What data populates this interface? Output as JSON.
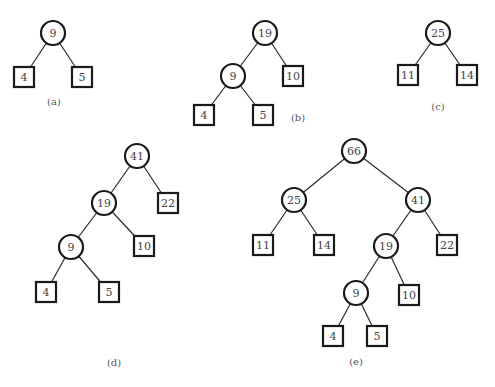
{
  "figure": {
    "style": {
      "stroke_color": "#1a1a1a",
      "text_color": "#444444",
      "background": "#ffffff"
    },
    "panels": [
      {
        "id": "a",
        "caption": "(a)",
        "caption_pos": [
          54,
          102
        ],
        "nodes": [
          {
            "id": "a9",
            "label": "9",
            "type": "circle",
            "x": 53,
            "y": 33
          },
          {
            "id": "a4",
            "label": "4",
            "type": "box",
            "x": 24,
            "y": 77
          },
          {
            "id": "a5",
            "label": "5",
            "type": "box",
            "x": 82,
            "y": 77
          }
        ],
        "edges": [
          [
            "a9",
            "a4"
          ],
          [
            "a9",
            "a5"
          ]
        ]
      },
      {
        "id": "b",
        "caption": "(b)",
        "caption_pos": [
          298,
          118
        ],
        "nodes": [
          {
            "id": "b19",
            "label": "19",
            "type": "circle",
            "x": 265,
            "y": 33
          },
          {
            "id": "b9",
            "label": "9",
            "type": "circle",
            "x": 233,
            "y": 76
          },
          {
            "id": "b10",
            "label": "10",
            "type": "box",
            "x": 293,
            "y": 76
          },
          {
            "id": "b4",
            "label": "4",
            "type": "box",
            "x": 204,
            "y": 115
          },
          {
            "id": "b5",
            "label": "5",
            "type": "box",
            "x": 263,
            "y": 115
          }
        ],
        "edges": [
          [
            "b19",
            "b9"
          ],
          [
            "b19",
            "b10"
          ],
          [
            "b9",
            "b4"
          ],
          [
            "b9",
            "b5"
          ]
        ]
      },
      {
        "id": "c",
        "caption": "(c)",
        "caption_pos": [
          438,
          107
        ],
        "nodes": [
          {
            "id": "c25",
            "label": "25",
            "type": "circle",
            "x": 438,
            "y": 33
          },
          {
            "id": "c11",
            "label": "11",
            "type": "box",
            "x": 408,
            "y": 75
          },
          {
            "id": "c14",
            "label": "14",
            "type": "box",
            "x": 467,
            "y": 75
          }
        ],
        "edges": [
          [
            "c25",
            "c11"
          ],
          [
            "c25",
            "c14"
          ]
        ]
      },
      {
        "id": "d",
        "caption": "(d)",
        "caption_pos": [
          114,
          363
        ],
        "nodes": [
          {
            "id": "d41",
            "label": "41",
            "type": "circle",
            "x": 137,
            "y": 156
          },
          {
            "id": "d19",
            "label": "19",
            "type": "circle",
            "x": 104,
            "y": 203
          },
          {
            "id": "d22",
            "label": "22",
            "type": "box",
            "x": 168,
            "y": 203
          },
          {
            "id": "d9",
            "label": "9",
            "type": "circle",
            "x": 71,
            "y": 247
          },
          {
            "id": "d10",
            "label": "10",
            "type": "box",
            "x": 144,
            "y": 246
          },
          {
            "id": "d4",
            "label": "4",
            "type": "box",
            "x": 46,
            "y": 292
          },
          {
            "id": "d5",
            "label": "5",
            "type": "box",
            "x": 109,
            "y": 292
          }
        ],
        "edges": [
          [
            "d41",
            "d19"
          ],
          [
            "d41",
            "d22"
          ],
          [
            "d19",
            "d9"
          ],
          [
            "d19",
            "d10"
          ],
          [
            "d9",
            "d4"
          ],
          [
            "d9",
            "d5"
          ]
        ]
      },
      {
        "id": "e",
        "caption": "(e)",
        "caption_pos": [
          356,
          362
        ],
        "nodes": [
          {
            "id": "e66",
            "label": "66",
            "type": "circle",
            "x": 354,
            "y": 151
          },
          {
            "id": "e25",
            "label": "25",
            "type": "circle",
            "x": 294,
            "y": 200
          },
          {
            "id": "e41",
            "label": "41",
            "type": "circle",
            "x": 418,
            "y": 200
          },
          {
            "id": "e11",
            "label": "11",
            "type": "box",
            "x": 263,
            "y": 245
          },
          {
            "id": "e14",
            "label": "14",
            "type": "box",
            "x": 324,
            "y": 245
          },
          {
            "id": "e19",
            "label": "19",
            "type": "circle",
            "x": 386,
            "y": 246
          },
          {
            "id": "e22",
            "label": "22",
            "type": "box",
            "x": 447,
            "y": 245
          },
          {
            "id": "e9",
            "label": "9",
            "type": "circle",
            "x": 356,
            "y": 293
          },
          {
            "id": "e10",
            "label": "10",
            "type": "box",
            "x": 409,
            "y": 295
          },
          {
            "id": "e4",
            "label": "4",
            "type": "box",
            "x": 333,
            "y": 336
          },
          {
            "id": "e5",
            "label": "5",
            "type": "box",
            "x": 377,
            "y": 336
          }
        ],
        "edges": [
          [
            "e66",
            "e25"
          ],
          [
            "e66",
            "e41"
          ],
          [
            "e25",
            "e11"
          ],
          [
            "e25",
            "e14"
          ],
          [
            "e41",
            "e19"
          ],
          [
            "e41",
            "e22"
          ],
          [
            "e19",
            "e9"
          ],
          [
            "e19",
            "e10"
          ],
          [
            "e9",
            "e4"
          ],
          [
            "e9",
            "e5"
          ]
        ]
      }
    ]
  }
}
